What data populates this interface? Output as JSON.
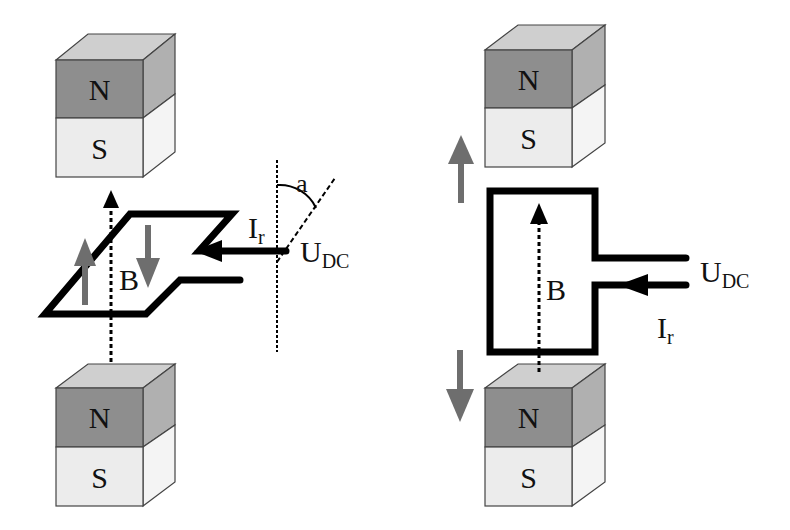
{
  "colors": {
    "north_face": "#8e8e8e",
    "north_top": "#cfcfcf",
    "north_side": "#b0b0b0",
    "south_face": "#ececec",
    "south_side": "#f4f4f4",
    "wire": "#000000",
    "force_arrow": "#6e6e6e",
    "field_line": "#000000"
  },
  "left_panel": {
    "top_magnet": {
      "north_label": "N",
      "south_label": "S"
    },
    "bottom_magnet": {
      "north_label": "N",
      "south_label": "S"
    },
    "field_label": "B",
    "current_label": "I",
    "current_subscript": "r",
    "voltage_label": "U",
    "voltage_subscript": "DC",
    "angle_label": "a"
  },
  "right_panel": {
    "top_magnet": {
      "north_label": "N",
      "south_label": "S"
    },
    "bottom_magnet": {
      "north_label": "N",
      "south_label": "S"
    },
    "field_label": "B",
    "current_label": "I",
    "current_subscript": "r",
    "voltage_label": "U",
    "voltage_subscript": "DC"
  }
}
